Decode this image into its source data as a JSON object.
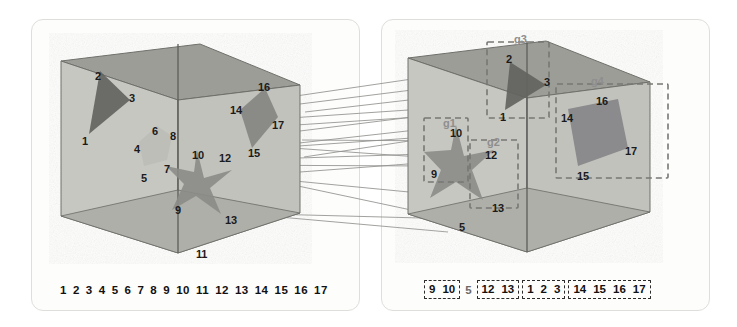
{
  "figure": {
    "type": "diagram",
    "panels": [
      {
        "id": "left",
        "name": "left-volume-panel",
        "grouped": false,
        "shapes": [
          {
            "name": "triangle",
            "tone": "dark",
            "vertices": [
              "1",
              "2",
              "3"
            ]
          },
          {
            "name": "pentagon",
            "tone": "light",
            "vertices": [
              "4",
              "5",
              "6",
              "7",
              "8"
            ]
          },
          {
            "name": "star",
            "tone": "medium",
            "vertices": [
              "9",
              "10",
              "11",
              "12",
              "13"
            ]
          },
          {
            "name": "quad",
            "tone": "medium",
            "vertices": [
              "14",
              "15",
              "16",
              "17"
            ]
          }
        ],
        "point_labels": [
          {
            "text": "1",
            "x": 82,
            "y": 136
          },
          {
            "text": "2",
            "x": 95,
            "y": 71
          },
          {
            "text": "3",
            "x": 129,
            "y": 93
          },
          {
            "text": "4",
            "x": 134,
            "y": 144
          },
          {
            "text": "5",
            "x": 141,
            "y": 173
          },
          {
            "text": "6",
            "x": 152,
            "y": 126
          },
          {
            "text": "7",
            "x": 164,
            "y": 164
          },
          {
            "text": "8",
            "x": 170,
            "y": 131
          },
          {
            "text": "9",
            "x": 175,
            "y": 205
          },
          {
            "text": "10",
            "x": 192,
            "y": 150
          },
          {
            "text": "11",
            "x": 196,
            "y": 249
          },
          {
            "text": "12",
            "x": 219,
            "y": 153
          },
          {
            "text": "13",
            "x": 225,
            "y": 215
          },
          {
            "text": "14",
            "x": 230,
            "y": 105
          },
          {
            "text": "15",
            "x": 248,
            "y": 148
          },
          {
            "text": "16",
            "x": 258,
            "y": 82
          },
          {
            "text": "17",
            "x": 272,
            "y": 120
          }
        ],
        "strip": {
          "name": "left-index-strip",
          "items": [
            "1",
            "2",
            "3",
            "4",
            "5",
            "6",
            "7",
            "8",
            "9",
            "10",
            "11",
            "12",
            "13",
            "14",
            "15",
            "16",
            "17"
          ]
        }
      },
      {
        "id": "right",
        "name": "right-volume-panel",
        "grouped": true,
        "shapes": [
          {
            "name": "triangle",
            "tone": "dark",
            "vertices": [
              "1",
              "2",
              "3"
            ]
          },
          {
            "name": "star",
            "tone": "medium",
            "vertices": [
              "9",
              "10",
              "5",
              "12",
              "13"
            ]
          },
          {
            "name": "quad",
            "tone": "medium",
            "vertices": [
              "14",
              "15",
              "16",
              "17"
            ]
          }
        ],
        "point_labels": [
          {
            "text": "2",
            "x": 506,
            "y": 54
          },
          {
            "text": "3",
            "x": 544,
            "y": 77
          },
          {
            "text": "1",
            "x": 500,
            "y": 112
          },
          {
            "text": "14",
            "x": 561,
            "y": 113
          },
          {
            "text": "16",
            "x": 596,
            "y": 96
          },
          {
            "text": "17",
            "x": 625,
            "y": 146
          },
          {
            "text": "15",
            "x": 577,
            "y": 171
          },
          {
            "text": "10",
            "x": 450,
            "y": 128
          },
          {
            "text": "9",
            "x": 431,
            "y": 169
          },
          {
            "text": "12",
            "x": 485,
            "y": 150
          },
          {
            "text": "13",
            "x": 492,
            "y": 203
          },
          {
            "text": "5",
            "x": 459,
            "y": 222
          }
        ],
        "group_labels": [
          {
            "text": "g1",
            "x": 443,
            "y": 117
          },
          {
            "text": "g2",
            "x": 487,
            "y": 136
          },
          {
            "text": "g3",
            "x": 514,
            "y": 33
          },
          {
            "text": "g4",
            "x": 591,
            "y": 75
          }
        ],
        "strip": {
          "name": "right-index-strip",
          "groups": [
            {
              "boxed": true,
              "items": [
                "9",
                "10"
              ]
            },
            {
              "boxed": false,
              "items": [
                "5"
              ]
            },
            {
              "boxed": true,
              "items": [
                "12",
                "13"
              ]
            },
            {
              "boxed": true,
              "items": [
                "1",
                "2",
                "3"
              ]
            },
            {
              "boxed": true,
              "items": [
                "14",
                "15",
                "16",
                "17"
              ]
            }
          ]
        }
      }
    ],
    "colors": {
      "panel_border": "#dededa",
      "cube_front": "#c9c9c4",
      "cube_top": "#9d9d98",
      "cube_floor": "#b0b0ab",
      "cube_edge": "#6a6a66",
      "shape_dark": "#6b6b68",
      "shape_medium": "#8d8d89",
      "shape_light": "#c0c0bb",
      "dashed_group": "#7d7d79",
      "correspondence_line": "#8a8a86",
      "label_text": "#1b1b1b",
      "group_label_text": "#8e8e8e"
    }
  }
}
